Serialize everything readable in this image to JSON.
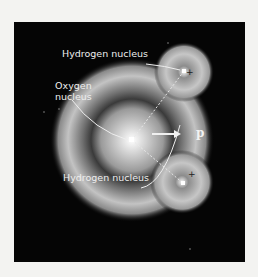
{
  "figure": {
    "labels": {
      "hydrogen_top": "Hydrogen nucleus",
      "oxygen": "Oxygen nucleus",
      "oxygen_line1": "Oxygen",
      "oxygen_line2": "nucleus",
      "hydrogen_bottom": "Hydrogen nucleus",
      "dipole_moment": "p"
    },
    "symbols": {
      "hydrogen_top_charge": "+",
      "hydrogen_bottom_charge": "+"
    },
    "colors": {
      "background": "#050505",
      "page": "#f3f3f1",
      "cloud": "#bdbdbd",
      "label": "#eeeeee"
    }
  }
}
